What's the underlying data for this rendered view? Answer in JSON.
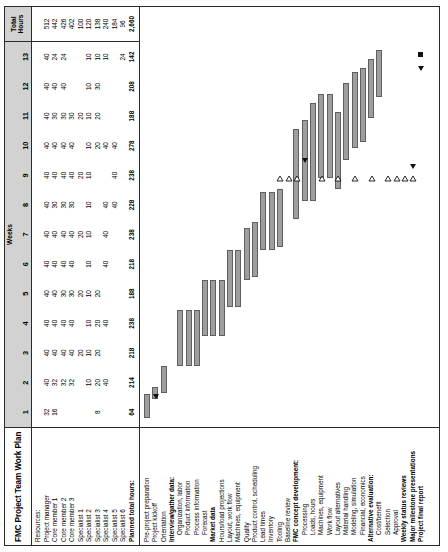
{
  "document": {
    "title": "FMC Project Team Work Plan",
    "weeks_label": "Weeks",
    "total_label_line1": "Total",
    "total_label_line2": "Hours",
    "week_numbers": [
      "1",
      "2",
      "3",
      "4",
      "5",
      "6",
      "7",
      "8",
      "9",
      "10",
      "11",
      "12",
      "13"
    ]
  },
  "resources": {
    "heading": "Resources:",
    "rows": [
      {
        "name": "Project manager",
        "bold": false,
        "weeks": [
          "32",
          "40",
          "40",
          "40",
          "40",
          "40",
          "40",
          "40",
          "40",
          "40",
          "40",
          "40",
          "40"
        ],
        "total": "512"
      },
      {
        "name": "Core member 1",
        "bold": false,
        "weeks": [
          "16",
          "32",
          "40",
          "40",
          "40",
          "40",
          "40",
          "30",
          "40",
          "40",
          "30",
          "40",
          "24"
        ],
        "total": "442"
      },
      {
        "name": "Core member 2",
        "bold": false,
        "weeks": [
          "",
          "32",
          "40",
          "40",
          "30",
          "40",
          "40",
          "30",
          "40",
          "40",
          "30",
          "40",
          "24"
        ],
        "total": "426"
      },
      {
        "name": "Core member 3",
        "bold": false,
        "weeks": [
          "",
          "32",
          "40",
          "40",
          "30",
          "40",
          "40",
          "30",
          "40",
          "40",
          "30",
          "",
          " "
        ],
        "total": "402"
      },
      {
        "name": "Specialist 1",
        "bold": false,
        "weeks": [
          "",
          "",
          "20",
          "",
          "20",
          "",
          "20",
          "",
          "20",
          "",
          "20",
          "",
          ""
        ],
        "total": "100"
      },
      {
        "name": "Specialist 2",
        "bold": false,
        "weeks": [
          "",
          "10",
          "10",
          "10",
          "10",
          "10",
          "10",
          "10",
          "10",
          "10",
          "10",
          "10",
          "10"
        ],
        "total": "120"
      },
      {
        "name": "Specialist 3",
        "bold": false,
        "weeks": [
          "8",
          "20",
          "20",
          "20",
          "20",
          "",
          "",
          "",
          "",
          "20",
          "20",
          "30",
          "10"
        ],
        "total": "138"
      },
      {
        "name": "Specialist 4",
        "bold": false,
        "weeks": [
          "",
          "40",
          "",
          "40",
          "",
          "40",
          "40",
          "40",
          "",
          "40",
          "",
          "",
          "10"
        ],
        "total": "240"
      },
      {
        "name": "Specialist 5",
        "bold": false,
        "weeks": [
          "",
          "",
          "",
          "",
          "",
          "",
          "",
          "40",
          "40",
          "40",
          "",
          "",
          ""
        ],
        "total": "184"
      },
      {
        "name": "Specialist 6",
        "bold": false,
        "weeks": [
          "",
          "",
          "",
          "",
          "",
          "",
          "",
          "",
          "",
          "",
          "",
          "",
          "24"
        ],
        "total": "96"
      },
      {
        "name": "Planned total hours:",
        "bold": true,
        "weeks": [
          "64",
          "214",
          "218",
          "238",
          "188",
          "218",
          "238",
          "228",
          "238",
          "278",
          "188",
          "208",
          "142"
        ],
        "total": "2,660"
      }
    ],
    "extra_eight_rows": [
      "8",
      "8",
      "8",
      "8",
      "8",
      "8",
      "8",
      "8",
      "8",
      "8",
      "8",
      "8",
      "8"
    ]
  },
  "tasks": [
    {
      "label": "Pre-project preparation",
      "bold": false,
      "indent": 0,
      "bar": {
        "start": 0.3,
        "end": 1.1
      },
      "marker": null
    },
    {
      "label": "Project kickoff",
      "bold": false,
      "indent": 0,
      "bar": {
        "start": 0.95,
        "end": 1.35
      },
      "marker": {
        "type": "filled-triangle",
        "pos": 1.02
      }
    },
    {
      "label": "Orientation",
      "bold": false,
      "indent": 0,
      "bar": {
        "start": 1.15,
        "end": 2.05
      },
      "marker": null
    },
    {
      "label": "Interview/gather data:",
      "bold": true,
      "indent": 0,
      "bar": null,
      "marker": null
    },
    {
      "label": "Organization, labor",
      "bold": false,
      "indent": 1,
      "bar": {
        "start": 2.05,
        "end": 3.95
      },
      "marker": null
    },
    {
      "label": "Product information",
      "bold": false,
      "indent": 1,
      "bar": {
        "start": 2.05,
        "end": 3.95
      },
      "marker": null
    },
    {
      "label": "Process information",
      "bold": false,
      "indent": 1,
      "bar": {
        "start": 2.05,
        "end": 3.95
      },
      "marker": null
    },
    {
      "label": "Forecast",
      "bold": false,
      "indent": 1,
      "bar": {
        "start": 3.05,
        "end": 4.95
      },
      "marker": null
    },
    {
      "label": "Market data",
      "bold": true,
      "indent": 0,
      "bar": {
        "start": 3.05,
        "end": 4.95
      },
      "marker": null
    },
    {
      "label": "Hours/load projections",
      "bold": false,
      "indent": 0,
      "bar": {
        "start": 3.05,
        "end": 4.95
      },
      "marker": null
    },
    {
      "label": "Layout, work flow",
      "bold": false,
      "indent": 0,
      "bar": {
        "start": 4.05,
        "end": 5.95
      },
      "marker": null
    },
    {
      "label": "Machines, equipment",
      "bold": false,
      "indent": 0,
      "bar": {
        "start": 4.05,
        "end": 5.95
      },
      "marker": null
    },
    {
      "label": "Quality",
      "bold": false,
      "indent": 0,
      "bar": {
        "start": 4.95,
        "end": 6.7
      },
      "marker": null
    },
    {
      "label": "Product control, scheduling",
      "bold": false,
      "indent": 0,
      "bar": {
        "start": 5.05,
        "end": 6.9
      },
      "marker": null
    },
    {
      "label": "Lead times",
      "bold": false,
      "indent": 0,
      "bar": {
        "start": 5.95,
        "end": 7.9
      },
      "marker": null
    },
    {
      "label": "Inventory",
      "bold": false,
      "indent": 0,
      "bar": {
        "start": 5.95,
        "end": 7.9
      },
      "marker": null
    },
    {
      "label": "Tooling",
      "bold": false,
      "indent": 0,
      "bar": {
        "start": 6.05,
        "end": 8.0
      },
      "marker": {
        "type": "open-triangle",
        "pos": 8.35
      }
    },
    {
      "label": "Baseline review",
      "bold": false,
      "indent": 0,
      "bar": null,
      "marker": {
        "type": "open-triangle",
        "pos": 8.35
      }
    },
    {
      "label": "FMC concept development:",
      "bold": true,
      "indent": 0,
      "bar": {
        "start": 7.0,
        "end": 10.05
      },
      "marker": {
        "type": "open-triangle",
        "pos": 8.35
      }
    },
    {
      "label": "Processing",
      "bold": false,
      "indent": 1,
      "bar": {
        "start": 7.6,
        "end": 10.35
      },
      "marker": {
        "type": "filled-triangle",
        "pos": 8.95
      }
    },
    {
      "label": "Loads, hours",
      "bold": false,
      "indent": 1,
      "bar": {
        "start": 7.6,
        "end": 10.9
      },
      "marker": null
    },
    {
      "label": "Machines, equipment",
      "bold": false,
      "indent": 1,
      "bar": {
        "start": 8.4,
        "end": 11.2
      },
      "marker": {
        "type": "open-triangle",
        "pos": 8.35
      }
    },
    {
      "label": "Work flow",
      "bold": false,
      "indent": 1,
      "bar": {
        "start": 8.4,
        "end": 11.2
      },
      "marker": null
    },
    {
      "label": "Layout alternatives",
      "bold": false,
      "indent": 1,
      "bar": {
        "start": 8.0,
        "end": 10.6
      },
      "marker": {
        "type": "open-triangle",
        "pos": 8.35
      }
    },
    {
      "label": "Material handling",
      "bold": false,
      "indent": 1,
      "bar": {
        "start": 9.0,
        "end": 11.6
      },
      "marker": null
    },
    {
      "label": "Modeling, simulation",
      "bold": false,
      "indent": 1,
      "bar": {
        "start": 9.4,
        "end": 11.95
      },
      "marker": {
        "type": "open-triangle",
        "pos": 8.35
      }
    },
    {
      "label": "Financial, economics",
      "bold": false,
      "indent": 1,
      "bar": {
        "start": 9.6,
        "end": 12.1
      },
      "marker": null
    },
    {
      "label": "Alternative evaluation:",
      "bold": true,
      "indent": 0,
      "bar": {
        "start": 10.4,
        "end": 12.4
      },
      "marker": {
        "type": "open-triangle",
        "pos": 8.35
      }
    },
    {
      "label": "Cost/benefit",
      "bold": false,
      "indent": 1,
      "bar": {
        "start": 11.1,
        "end": 12.7
      },
      "marker": null
    },
    {
      "label": "Selection",
      "bold": false,
      "indent": 1,
      "bar": null,
      "marker": {
        "type": "open-triangle",
        "pos": 8.35
      }
    },
    {
      "label": "Approval",
      "bold": false,
      "indent": 1,
      "bar": null,
      "marker": {
        "type": "open-triangle",
        "pos": 8.35
      }
    },
    {
      "label": "Weekly status reviews",
      "bold": true,
      "indent": 0,
      "bar": null,
      "marker": {
        "type": "open-triangle",
        "pos": 8.35
      }
    },
    {
      "label": "Major milestone presentations",
      "bold": true,
      "indent": 0,
      "bar": null,
      "marker": {
        "type": "open-triangle-filled-pair",
        "pos": 8.35
      }
    },
    {
      "label": "Project final report",
      "bold": true,
      "indent": 0,
      "bar": null,
      "marker": {
        "type": "filled-square",
        "pos": 12.05
      }
    }
  ],
  "colors": {
    "bar_fill": "#9e9e9e",
    "bar_border": "#5f5f5f",
    "header_band": "#d2d2d2",
    "marker": "#111111",
    "rule": "#2a2a2a"
  }
}
